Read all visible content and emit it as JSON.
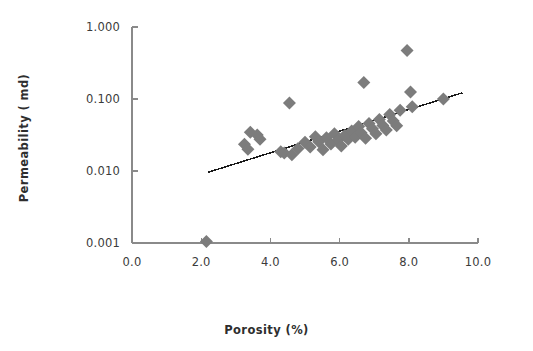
{
  "chart_data": {
    "type": "scatter",
    "title": "",
    "xlabel": "Porosity (%)",
    "ylabel": "Permeability ( md)",
    "xlim": [
      0.0,
      10.0
    ],
    "ylim": [
      0.001,
      1.0
    ],
    "yscale": "log",
    "xscale": "linear",
    "grid": false,
    "legend": "none",
    "x_ticks": [
      "0.0",
      "2.0",
      "4.0",
      "6.0",
      "8.0",
      "10.0"
    ],
    "x_tick_values": [
      0.0,
      2.0,
      4.0,
      6.0,
      8.0,
      10.0
    ],
    "y_ticks": [
      "1.000",
      "0.100",
      "0.010",
      "0.001"
    ],
    "y_tick_values": [
      1.0,
      0.1,
      0.01,
      0.001
    ],
    "marker": "diamond",
    "marker_color": "#7c7c7c",
    "marker_size": 13,
    "axis_color": "#8a8a8a",
    "trendline": {
      "present": true,
      "color": "#1a1a1a",
      "x_start": 2.2,
      "y_start": 0.0096,
      "x_end": 9.55,
      "y_end": 0.122
    },
    "series": [
      {
        "name": "Core samples",
        "points": [
          [
            2.15,
            0.00105
          ],
          [
            3.25,
            0.0235
          ],
          [
            3.35,
            0.02
          ],
          [
            3.42,
            0.0345
          ],
          [
            3.62,
            0.0315
          ],
          [
            3.7,
            0.0275
          ],
          [
            4.3,
            0.0185
          ],
          [
            4.4,
            0.0178
          ],
          [
            4.55,
            0.088
          ],
          [
            4.62,
            0.0168
          ],
          [
            4.8,
            0.0205
          ],
          [
            5.0,
            0.025
          ],
          [
            5.15,
            0.0215
          ],
          [
            5.3,
            0.03
          ],
          [
            5.4,
            0.0255
          ],
          [
            5.52,
            0.0198
          ],
          [
            5.62,
            0.029
          ],
          [
            5.75,
            0.0238
          ],
          [
            5.85,
            0.033
          ],
          [
            5.95,
            0.0268
          ],
          [
            6.05,
            0.0222
          ],
          [
            6.15,
            0.031
          ],
          [
            6.25,
            0.0275
          ],
          [
            6.35,
            0.036
          ],
          [
            6.45,
            0.0295
          ],
          [
            6.55,
            0.0415
          ],
          [
            6.62,
            0.034
          ],
          [
            6.7,
            0.17
          ],
          [
            6.75,
            0.0285
          ],
          [
            6.85,
            0.0455
          ],
          [
            6.95,
            0.0385
          ],
          [
            7.05,
            0.033
          ],
          [
            7.15,
            0.052
          ],
          [
            7.25,
            0.043
          ],
          [
            7.35,
            0.037
          ],
          [
            7.45,
            0.061
          ],
          [
            7.55,
            0.0495
          ],
          [
            7.65,
            0.0425
          ],
          [
            7.75,
            0.07
          ],
          [
            7.95,
            0.47
          ],
          [
            8.05,
            0.125
          ],
          [
            8.1,
            0.078
          ],
          [
            9.0,
            0.1
          ]
        ]
      }
    ]
  },
  "axis_titles": {
    "x": "Porosity (%)",
    "y": "Permeability ( md)"
  }
}
